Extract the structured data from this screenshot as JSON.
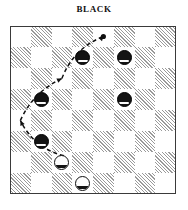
{
  "header": {
    "title": "BLACK"
  },
  "board": {
    "size": 8,
    "light_color": "#ffffff",
    "dark_color": "#9a9a9a",
    "border_color": "#3a3a3a",
    "rows": [
      [
        "light",
        "dark",
        "light",
        "dark",
        "light",
        "dark",
        "light",
        "dark"
      ],
      [
        "dark",
        "light",
        "dark",
        "light",
        "dark",
        "light",
        "dark",
        "light"
      ],
      [
        "light",
        "dark",
        "light",
        "dark",
        "light",
        "dark",
        "light",
        "dark"
      ],
      [
        "dark",
        "light",
        "dark",
        "light",
        "dark",
        "light",
        "dark",
        "light"
      ],
      [
        "light",
        "dark",
        "light",
        "dark",
        "light",
        "dark",
        "light",
        "dark"
      ],
      [
        "dark",
        "light",
        "dark",
        "light",
        "dark",
        "light",
        "dark",
        "light"
      ],
      [
        "light",
        "dark",
        "light",
        "dark",
        "light",
        "dark",
        "light",
        "dark"
      ],
      [
        "dark",
        "light",
        "dark",
        "light",
        "dark",
        "light",
        "dark",
        "light"
      ]
    ]
  },
  "pieces": [
    {
      "id": "black-piece-1",
      "color": "black",
      "row": 1,
      "col": 3
    },
    {
      "id": "black-piece-2",
      "color": "black",
      "row": 1,
      "col": 5
    },
    {
      "id": "black-piece-3",
      "color": "black",
      "row": 3,
      "col": 1
    },
    {
      "id": "black-piece-4",
      "color": "black",
      "row": 3,
      "col": 5
    },
    {
      "id": "black-piece-5",
      "color": "black",
      "row": 5,
      "col": 1
    },
    {
      "id": "white-piece-1",
      "color": "white",
      "row": 6,
      "col": 2
    },
    {
      "id": "white-piece-2",
      "color": "white",
      "row": 7,
      "col": 3
    }
  ],
  "move_path": {
    "style": "dashed-curve",
    "color": "#101010",
    "start": {
      "row": 6,
      "col": 2
    },
    "end": {
      "row": 0,
      "col": 4
    },
    "waypoints": [
      {
        "row": 6,
        "col": 2
      },
      {
        "row": 4,
        "col": 0
      },
      {
        "row": 2,
        "col": 2
      },
      {
        "row": 0,
        "col": 4
      }
    ],
    "arrowheads": 3,
    "endpoint_marker": "dot"
  }
}
